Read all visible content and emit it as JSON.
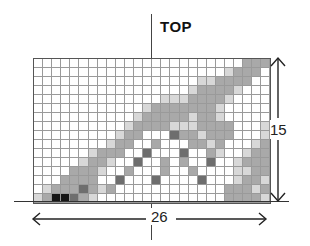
{
  "title": "TOP",
  "dimensions": {
    "width_label": "26",
    "height_label": "15"
  },
  "grid": {
    "columns": 26,
    "rows": 16,
    "legend": {
      "0": "#ffffff",
      "1": "#d8d8d8",
      "2": "#a9a9a9",
      "3": "#6e6e6e",
      "4": "#161616"
    },
    "cells": [
      "00000000000000000000000222",
      "00000000000000000000012220",
      "00000000000000000011222200",
      "00000000000000000122221000",
      "00000000000000111222210000",
      "00000000000012222222100000",
      "00000000000122222122100000",
      "00000000001222211122220001",
      "00000000012200032212220001",
      "00000000122002000221200012",
      "00000012220030003002100122",
      "00000122100300202003001222",
      "00002221002000200200001122",
      "00022220030003000030001221",
      "01222321200000000000022212",
      "12443210000000000000022221"
    ]
  }
}
